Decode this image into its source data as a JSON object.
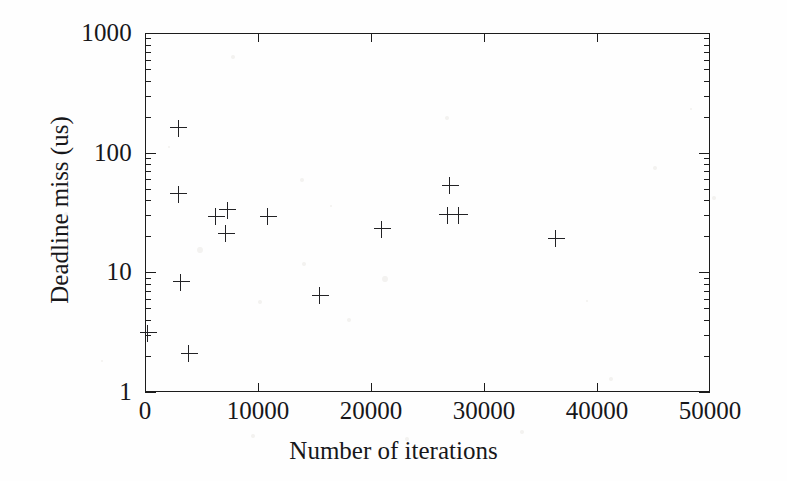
{
  "chart_data": {
    "type": "scatter",
    "title": "",
    "xlabel": "Number of iterations",
    "ylabel": "Deadline miss (us)",
    "xlim": [
      0,
      50000
    ],
    "ylim": [
      1,
      1000
    ],
    "yscale": "log",
    "xscale": "linear",
    "grid": false,
    "legend": null,
    "marker": "plus",
    "marker_color": "#222225",
    "xticks": [
      0,
      10000,
      20000,
      30000,
      40000,
      50000
    ],
    "xtick_labels": [
      "0",
      "10000",
      "20000",
      "30000",
      "40000",
      "50000"
    ],
    "yticks": [
      1,
      10,
      100,
      1000
    ],
    "ytick_labels": [
      "1",
      "10",
      "100",
      "1000"
    ],
    "y_minor_ticks": [
      2,
      3,
      4,
      5,
      6,
      7,
      8,
      9,
      20,
      30,
      40,
      50,
      60,
      70,
      80,
      90,
      200,
      300,
      400,
      500,
      600,
      700,
      800,
      900
    ],
    "points": [
      {
        "x": 300,
        "y": 3.1
      },
      {
        "x": 3000,
        "y": 160
      },
      {
        "x": 3000,
        "y": 45
      },
      {
        "x": 3200,
        "y": 8.3
      },
      {
        "x": 3900,
        "y": 2.1
      },
      {
        "x": 6300,
        "y": 29
      },
      {
        "x": 7300,
        "y": 33
      },
      {
        "x": 7200,
        "y": 21
      },
      {
        "x": 10900,
        "y": 29
      },
      {
        "x": 15500,
        "y": 6.4
      },
      {
        "x": 21000,
        "y": 23
      },
      {
        "x": 27000,
        "y": 53
      },
      {
        "x": 26800,
        "y": 30
      },
      {
        "x": 27800,
        "y": 30
      },
      {
        "x": 36400,
        "y": 19
      }
    ]
  },
  "figure": {
    "background_color": "#fefefe",
    "axis_color": "#1c1c1c",
    "text_color": "#17171a"
  }
}
